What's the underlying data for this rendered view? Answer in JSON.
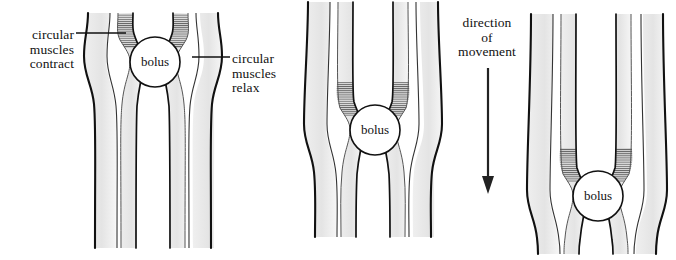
{
  "diagram": {
    "background_color": "#ffffff",
    "stroke_color": "#111111",
    "muscle_fill_color": "#e8e8e8",
    "lumen_fill_color": "#ffffff",
    "hatch_color": "#4a4a4a"
  },
  "labels": {
    "circular_muscles_contract": {
      "line1": "circular",
      "line2": "muscles",
      "line3": "contract"
    },
    "circular_muscles_relax": {
      "line1": "circular",
      "line2": "muscles",
      "line3": "relax"
    },
    "direction_of_movement": {
      "line1": "direction",
      "line2": "of",
      "line3": "movement"
    }
  },
  "panels": [
    {
      "id": "panel-1",
      "bolus_label": "bolus",
      "bolus_center_x": 155,
      "bolus_center_y": 62,
      "bolus_radius": 25,
      "stage": "bolus high in tube, circular muscles contract above it"
    },
    {
      "id": "panel-2",
      "bolus_label": "bolus",
      "bolus_center_x": 375,
      "bolus_center_y": 130,
      "bolus_radius": 25,
      "stage": "bolus mid tube, wave of contraction has moved down"
    },
    {
      "id": "panel-3",
      "bolus_label": "bolus",
      "bolus_center_x": 598,
      "bolus_center_y": 196,
      "bolus_radius": 25,
      "stage": "bolus low in tube, contraction wave near the bottom"
    }
  ],
  "arrow": {
    "name": "direction-of-movement-arrow",
    "x": 488,
    "y_start": 68,
    "y_end": 192,
    "orientation": "downward"
  },
  "leader_lines": [
    {
      "name": "leader-contract",
      "x1": 76,
      "y1": 33,
      "x2": 126,
      "y2": 33
    },
    {
      "name": "leader-relax",
      "x1": 192,
      "y1": 57,
      "x2": 230,
      "y2": 57
    }
  ]
}
